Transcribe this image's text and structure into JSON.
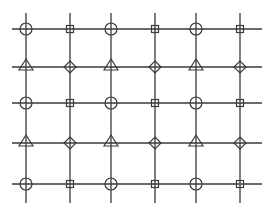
{
  "diagram": {
    "type": "symbol-grid",
    "stroke_color": "#3a3a3a",
    "background": "#ffffff",
    "columns_x": [
      26,
      70,
      111,
      155,
      196,
      240
    ],
    "rows_y": [
      29,
      67,
      103,
      143,
      184
    ],
    "h_line_extent": [
      12,
      262
    ],
    "v_line_extent": [
      13,
      203
    ],
    "rows": [
      [
        "circle",
        "square",
        "circle",
        "square",
        "circle",
        "square"
      ],
      [
        "triangle",
        "diamond",
        "triangle",
        "diamond",
        "triangle",
        "diamond"
      ],
      [
        "circle",
        "square",
        "circle",
        "square",
        "circle",
        "square"
      ],
      [
        "triangle",
        "diamond",
        "triangle",
        "diamond",
        "triangle",
        "diamond"
      ],
      [
        "circle",
        "square",
        "circle",
        "square",
        "circle",
        "square"
      ]
    ]
  }
}
